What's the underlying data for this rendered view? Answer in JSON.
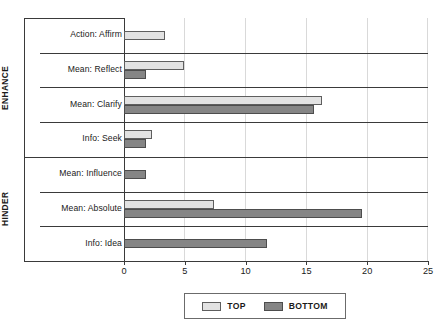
{
  "chart_data": {
    "type": "bar",
    "orientation": "horizontal",
    "title": "",
    "xlabel": "",
    "ylabel": "",
    "xlim": [
      0,
      25
    ],
    "xticks": [
      0,
      5,
      10,
      15,
      20,
      25
    ],
    "grid": true,
    "legend_position": "bottom",
    "categories": [
      "Action: Affirm",
      "Mean: Reflect",
      "Mean: Clarify",
      "Info: Seek",
      "Mean: Influence",
      "Mean: Absolute",
      "Info: Idea"
    ],
    "groups": [
      {
        "label": "ENHANCE",
        "categories": [
          "Action: Affirm",
          "Mean: Reflect",
          "Mean: Clarify",
          "Info: Seek"
        ]
      },
      {
        "label": "HINDER",
        "categories": [
          "Mean: Influence",
          "Mean: Absolute",
          "Info: Idea"
        ]
      }
    ],
    "series": [
      {
        "name": "TOP",
        "color": "#e2e2e2",
        "values": [
          3.4,
          4.9,
          16.3,
          2.3,
          0,
          7.4,
          0
        ]
      },
      {
        "name": "BOTTOM",
        "color": "#858585",
        "values": [
          0,
          1.8,
          15.6,
          1.8,
          1.8,
          19.6,
          11.8
        ]
      }
    ]
  },
  "legend": {
    "items": [
      {
        "label": "TOP"
      },
      {
        "label": "BOTTOM"
      }
    ]
  },
  "axis": {
    "tick_labels": [
      "0",
      "5",
      "10",
      "15",
      "20",
      "25"
    ]
  }
}
